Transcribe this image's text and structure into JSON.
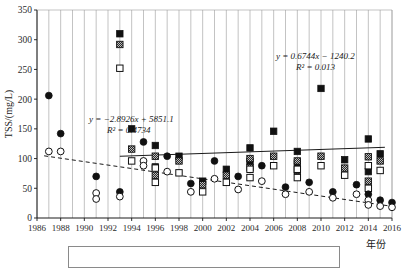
{
  "chart_data": {
    "type": "scatter",
    "title": "",
    "xlabel": "年份",
    "ylabel": "TSS/(mg/L)",
    "xlim": [
      1986,
      2016
    ],
    "ylim": [
      0,
      350
    ],
    "yticks": [
      0,
      50,
      100,
      150,
      200,
      250,
      300,
      350
    ],
    "xticks": [
      1986,
      1988,
      1990,
      1992,
      1994,
      1996,
      1998,
      2000,
      2002,
      2004,
      2006,
      2008,
      2010,
      2012,
      2014,
      2016
    ],
    "grid": "vertical-annual",
    "legend": "bottom-box",
    "annotations": [
      {
        "name": "trend-declining",
        "equation": "y = −2.8926x + 5851.1",
        "r2": "R² = 0.4734",
        "x": 1990.4,
        "y": 162
      },
      {
        "name": "trend-rising",
        "equation": "y = 0.6744x − 1240.2",
        "r2": "R² = 0.013",
        "x": 2006.2,
        "y": 268
      }
    ],
    "trendlines": [
      {
        "name": "declining-dashed",
        "style": "dashed",
        "slope": -2.8926,
        "intercept": 5851.1,
        "x_start": 1986.6,
        "x_end": 2016.0
      },
      {
        "name": "rising-solid",
        "style": "solid",
        "slope": 0.6744,
        "intercept": -1240.2,
        "x_start": 1993.0,
        "x_end": 2015.4
      }
    ],
    "series": [
      {
        "name": "filled-square",
        "marker": "filled-square",
        "points": [
          [
            1993,
            310
          ],
          [
            1994,
            150
          ],
          [
            1996,
            122
          ],
          [
            1996,
            86
          ],
          [
            1998,
            104
          ],
          [
            2000,
            62
          ],
          [
            2002,
            82
          ],
          [
            2004,
            118
          ],
          [
            2004,
            95
          ],
          [
            2006,
            146
          ],
          [
            2008,
            112
          ],
          [
            2008,
            92
          ],
          [
            2010,
            218
          ],
          [
            2012,
            98
          ],
          [
            2014,
            133
          ],
          [
            2014,
            78
          ],
          [
            2015,
            108
          ]
        ]
      },
      {
        "name": "hatched-square",
        "marker": "hatched-square",
        "points": [
          [
            1993,
            292
          ],
          [
            1994,
            116
          ],
          [
            1996,
            104
          ],
          [
            1996,
            72
          ],
          [
            1998,
            96
          ],
          [
            2000,
            56
          ],
          [
            2002,
            72
          ],
          [
            2004,
            100
          ],
          [
            2004,
            85
          ],
          [
            2006,
            104
          ],
          [
            2008,
            96
          ],
          [
            2008,
            80
          ],
          [
            2010,
            104
          ],
          [
            2012,
            84
          ],
          [
            2014,
            103
          ],
          [
            2015,
            96
          ],
          [
            2014,
            62
          ]
        ]
      },
      {
        "name": "open-square",
        "marker": "open-square",
        "points": [
          [
            1993,
            252
          ],
          [
            1994,
            96
          ],
          [
            1996,
            84
          ],
          [
            1996,
            60
          ],
          [
            1998,
            76
          ],
          [
            2000,
            44
          ],
          [
            2002,
            60
          ],
          [
            2004,
            82
          ],
          [
            2004,
            68
          ],
          [
            2006,
            88
          ],
          [
            2008,
            82
          ],
          [
            2008,
            68
          ],
          [
            2010,
            88
          ],
          [
            2012,
            72
          ],
          [
            2014,
            88
          ],
          [
            2015,
            80
          ],
          [
            2014,
            50
          ]
        ]
      },
      {
        "name": "filled-circle",
        "marker": "filled-circle",
        "points": [
          [
            1987,
            206
          ],
          [
            1988,
            142
          ],
          [
            1991,
            70
          ],
          [
            1993,
            44
          ],
          [
            1995,
            128
          ],
          [
            1997,
            104
          ],
          [
            1999,
            58
          ],
          [
            2001,
            96
          ],
          [
            2003,
            70
          ],
          [
            2005,
            88
          ],
          [
            2007,
            52
          ],
          [
            2009,
            60
          ],
          [
            2011,
            44
          ],
          [
            2013,
            56
          ],
          [
            2014,
            40
          ],
          [
            2015,
            30
          ],
          [
            2016,
            26
          ]
        ]
      },
      {
        "name": "open-circle",
        "marker": "open-circle",
        "points": [
          [
            1987,
            112
          ],
          [
            1988,
            112
          ],
          [
            1991,
            42
          ],
          [
            1991,
            32
          ],
          [
            1993,
            36
          ],
          [
            1995,
            96
          ],
          [
            1995,
            88
          ],
          [
            1997,
            78
          ],
          [
            1999,
            44
          ],
          [
            2001,
            66
          ],
          [
            2003,
            48
          ],
          [
            2005,
            62
          ],
          [
            2007,
            40
          ],
          [
            2009,
            44
          ],
          [
            2011,
            34
          ],
          [
            2013,
            40
          ],
          [
            2014,
            30
          ],
          [
            2014,
            22
          ],
          [
            2015,
            20
          ],
          [
            2016,
            18
          ]
        ]
      }
    ]
  },
  "axes": {
    "y_title": "TSS/(mg/L)",
    "x_title": "年份",
    "y_tick_labels": [
      "0",
      "50",
      "100",
      "150",
      "200",
      "250",
      "300",
      "350"
    ],
    "x_tick_labels": [
      "1986",
      "1988",
      "1990",
      "1992",
      "1994",
      "1996",
      "1998",
      "2000",
      "2002",
      "2004",
      "2006",
      "2008",
      "2010",
      "2012",
      "2014",
      "2016"
    ]
  },
  "annotations": {
    "eq1_line1": "y = −2.8926x + 5851.1",
    "eq1_line2": "R² = 0.4734",
    "eq2_line1": "y = 0.6744x − 1240.2",
    "eq2_line2": "R² = 0.013"
  }
}
